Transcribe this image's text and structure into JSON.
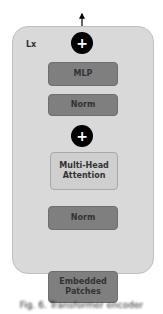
{
  "diagram": {
    "container_label": "Lx",
    "blocks": {
      "mlp": "MLP",
      "norm_top": "Norm",
      "attention": "Multi-Head Attention",
      "norm_bottom": "Norm",
      "input": "Embedded Patches"
    },
    "add_symbol": "+",
    "caption": "Fig. 6.  Transformer encoder"
  },
  "colors": {
    "panel": "#d9d9d9",
    "dark_block": "#7f7f7f",
    "light_block": "#cfcfcf",
    "add_node": "#000000",
    "lines": "#000000"
  }
}
